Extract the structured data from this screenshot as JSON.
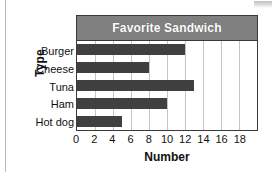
{
  "chart_data": {
    "type": "bar",
    "orientation": "horizontal",
    "title": "Favorite Sandwich",
    "categories": [
      "Burger",
      "Cheese",
      "Tuna",
      "Ham",
      "Hot dog"
    ],
    "values": [
      12,
      8,
      13,
      10,
      5
    ],
    "xlabel": "Number",
    "ylabel": "Type",
    "xlim": [
      0,
      20
    ],
    "xticks": [
      0,
      2,
      4,
      6,
      8,
      10,
      12,
      14,
      16,
      18
    ],
    "xtick_labels": [
      "0",
      "2",
      "4",
      "6",
      "8",
      "10",
      "12",
      "14",
      "16",
      "18"
    ],
    "grid": "vertical",
    "legend": null,
    "colors": {
      "bar": "#404040",
      "title_banner": "#808080",
      "title_text": "#ffffff",
      "gridline": "#c4c4c4",
      "axis": "#3a3a3a",
      "plot_background": "#ffffff"
    }
  }
}
